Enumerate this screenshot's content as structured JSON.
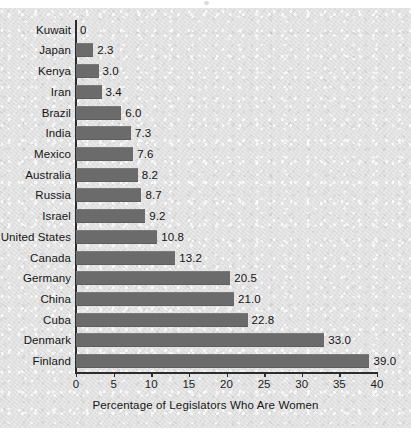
{
  "chart_data": {
    "type": "bar",
    "orientation": "horizontal",
    "title": "",
    "xlabel": "Percentage of Legislators Who Are Women",
    "ylabel": "",
    "xlim": [
      0,
      40
    ],
    "xticks": [
      0,
      5,
      10,
      15,
      20,
      25,
      30,
      35,
      40
    ],
    "xtick_labels": [
      "0",
      "5",
      "10",
      "15",
      "20",
      "25",
      "30",
      "35",
      "40"
    ],
    "grid": false,
    "legend": false,
    "bar_color": "#6b6b6b",
    "background_color": "#e2e2e2",
    "axis_color": "#2c2c2c",
    "categories": [
      "Kuwait",
      "Japan",
      "Kenya",
      "Iran",
      "Brazil",
      "India",
      "Mexico",
      "Australia",
      "Russia",
      "Israel",
      "United States",
      "Canada",
      "Germany",
      "China",
      "Cuba",
      "Denmark",
      "Finland"
    ],
    "values": [
      0,
      2.3,
      3.0,
      3.4,
      6.0,
      7.3,
      7.6,
      8.2,
      8.7,
      9.2,
      10.8,
      13.2,
      20.5,
      21.0,
      22.8,
      33.0,
      39.0
    ],
    "value_labels": [
      "0",
      "2.3",
      "3.0",
      "3.4",
      "6.0",
      "7.3",
      "7.6",
      "8.2",
      "8.7",
      "9.2",
      "10.8",
      "13.2",
      "20.5",
      "21.0",
      "22.8",
      "33.0",
      "39.0"
    ]
  }
}
